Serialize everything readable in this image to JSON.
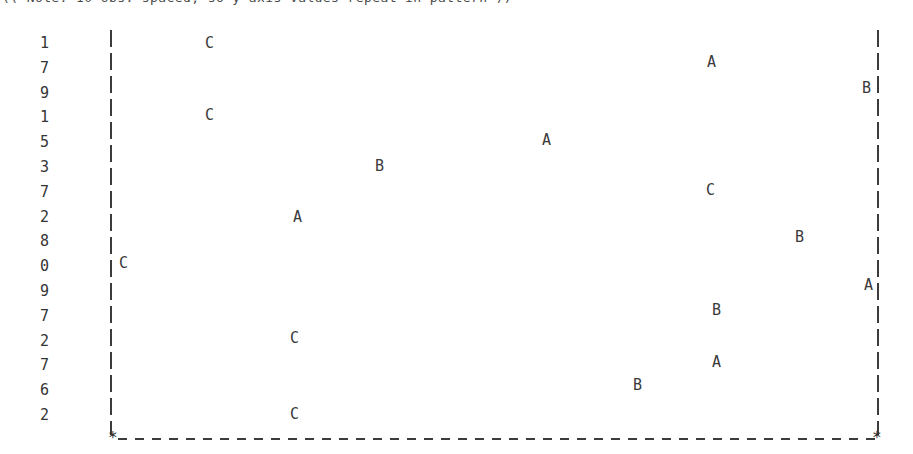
{
  "header": {
    "note": "(( Note: 10 obs. spaced, so y-axis values repeat in pattern ))"
  },
  "axis": {
    "y_ticks": [
      "1",
      "7",
      "9",
      "1",
      "5",
      "3",
      "7",
      "2",
      "8",
      "0",
      "9",
      "7",
      "2",
      "7",
      "6",
      "2"
    ],
    "left_rule_x": 110,
    "right_rule_x": 877,
    "baseline_y": 437,
    "start_marker": "*",
    "end_marker": "*",
    "line_color": "#3c3c3c",
    "text_color": "#3a3a3a",
    "background": "#ffffff"
  },
  "chart_data": {
    "type": "scatter",
    "title": "",
    "subtitle": "",
    "xlabel": "",
    "ylabel": "",
    "grid": false,
    "legend": "none",
    "row_labels": [
      "1",
      "7",
      "9",
      "1",
      "5",
      "3",
      "7",
      "2",
      "8",
      "0",
      "9",
      "7",
      "2",
      "7",
      "6",
      "2"
    ],
    "xlim": [
      110,
      877
    ],
    "series": [
      {
        "name": "A",
        "label": "A",
        "points": [
          {
            "row": 2,
            "row_label": "7",
            "x": 707,
            "y": 62
          },
          {
            "row": 5,
            "row_label": "5",
            "x": 542,
            "y": 140
          },
          {
            "row": 8,
            "row_label": "2",
            "x": 293,
            "y": 217
          },
          {
            "row": 11,
            "row_label": "9",
            "x": 864,
            "y": 285
          },
          {
            "row": 14,
            "row_label": "7",
            "x": 712,
            "y": 362
          }
        ]
      },
      {
        "name": "B",
        "label": "B",
        "points": [
          {
            "row": 3,
            "row_label": "9",
            "x": 862,
            "y": 88
          },
          {
            "row": 6,
            "row_label": "3",
            "x": 375,
            "y": 166
          },
          {
            "row": 9,
            "row_label": "8",
            "x": 795,
            "y": 237
          },
          {
            "row": 12,
            "row_label": "7",
            "x": 712,
            "y": 310
          },
          {
            "row": 15,
            "row_label": "6",
            "x": 633,
            "y": 385
          }
        ]
      },
      {
        "name": "C",
        "label": "C",
        "points": [
          {
            "row": 1,
            "row_label": "1",
            "x": 205,
            "y": 43
          },
          {
            "row": 4,
            "row_label": "1",
            "x": 205,
            "y": 115
          },
          {
            "row": 7,
            "row_label": "7",
            "x": 706,
            "y": 190
          },
          {
            "row": 10,
            "row_label": "0",
            "x": 119,
            "y": 263
          },
          {
            "row": 13,
            "row_label": "2",
            "x": 290,
            "y": 338
          },
          {
            "row": 16,
            "row_label": "2",
            "x": 290,
            "y": 414
          }
        ]
      }
    ]
  }
}
